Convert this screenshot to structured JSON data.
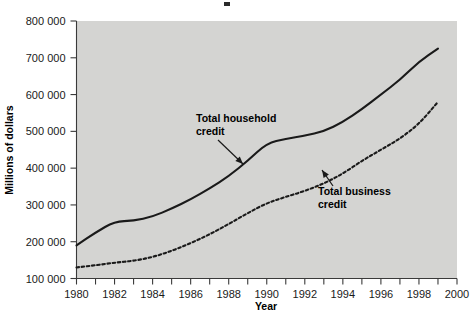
{
  "chart_data": {
    "type": "line",
    "title": "",
    "xlabel": "Year",
    "ylabel": "Millions of dollars",
    "xlim": [
      1980,
      2000
    ],
    "ylim": [
      100000,
      800000
    ],
    "grid": false,
    "legend_position": "inline-annotations",
    "background_color": "#d4d4d2",
    "line_color": "#1a1a1a",
    "x_tick_labels": [
      "1980",
      "1982",
      "1984",
      "1986",
      "1988",
      "1990",
      "1992",
      "1994",
      "1996",
      "1998",
      "2000"
    ],
    "x_tick_values": [
      1980,
      1982,
      1984,
      1986,
      1988,
      1990,
      1992,
      1994,
      1996,
      1998,
      2000
    ],
    "x_minor_ticks": [
      1981,
      1983,
      1985,
      1987,
      1989,
      1991,
      1993,
      1995,
      1997,
      1999
    ],
    "y_tick_labels": [
      "100 000",
      "200 000",
      "300 000",
      "400 000",
      "500 000",
      "600 000",
      "700 000",
      "800 000"
    ],
    "y_tick_values": [
      100000,
      200000,
      300000,
      400000,
      500000,
      600000,
      700000,
      800000
    ],
    "x": [
      1980,
      1981,
      1982,
      1983,
      1984,
      1985,
      1986,
      1987,
      1988,
      1989,
      1990,
      1991,
      1992,
      1993,
      1994,
      1995,
      1996,
      1997,
      1998,
      1999
    ],
    "series": [
      {
        "name": "Total household credit",
        "style": "solid",
        "values": [
          190000,
          225000,
          255000,
          257000,
          268000,
          290000,
          315000,
          345000,
          378000,
          420000,
          468000,
          480000,
          488000,
          500000,
          525000,
          560000,
          600000,
          640000,
          690000,
          725000
        ]
      },
      {
        "name": "Total business credit",
        "style": "dashed",
        "values": [
          130000,
          136000,
          143000,
          148000,
          158000,
          175000,
          196000,
          220000,
          248000,
          278000,
          305000,
          322000,
          338000,
          358000,
          385000,
          420000,
          450000,
          480000,
          520000,
          580000
        ]
      }
    ],
    "annotations": [
      {
        "label_line1": "Total household",
        "label_line2": "credit",
        "text_x": 196,
        "text_y": 122,
        "arrow_from_x": 218,
        "arrow_from_y": 140,
        "arrow_to_x": 243,
        "arrow_to_y": 164
      },
      {
        "label_line1": "Total business",
        "label_line2": "credit",
        "text_x": 318,
        "text_y": 195,
        "arrow_from_x": 333,
        "arrow_from_y": 186,
        "arrow_to_x": 322,
        "arrow_to_y": 170
      }
    ]
  }
}
